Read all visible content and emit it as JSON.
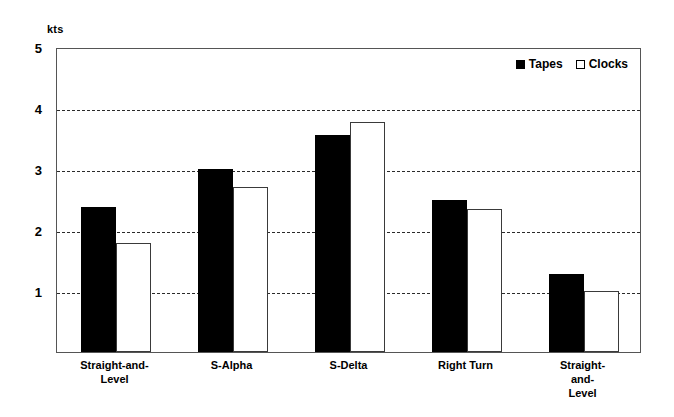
{
  "chart_data": {
    "type": "bar",
    "title": "",
    "subtitle": "",
    "xlabel": "",
    "ylabel": "kts",
    "unit_label": "kts",
    "ylim": [
      0,
      5
    ],
    "yticks": [
      1,
      2,
      3,
      4,
      5
    ],
    "ytick_labels": [
      "1",
      "2",
      "3",
      "4",
      "5"
    ],
    "grid": true,
    "grid_axis": "y",
    "grid_style": "dashed",
    "legend_position": "top-right",
    "categories": [
      "Straight-and-\nLevel",
      "S-Alpha",
      "S-Delta",
      "Right Turn",
      "Straight-and-\nLevel"
    ],
    "series": [
      {
        "name": "Tapes",
        "style": "filled",
        "color": "#000000",
        "values": [
          2.37,
          3.0,
          3.55,
          2.5,
          1.28
        ]
      },
      {
        "name": "Clocks",
        "style": "hollow",
        "color": "#ffffff",
        "values": [
          1.78,
          2.7,
          3.77,
          2.35,
          1.0
        ]
      }
    ]
  },
  "legend": {
    "entries": [
      {
        "label": "Tapes",
        "swatch": "filled-square-icon"
      },
      {
        "label": "Clocks",
        "swatch": "hollow-square-icon"
      }
    ]
  },
  "colors": {
    "background": "#ffffff",
    "axis": "#555555",
    "grid": "#2b2b2b",
    "tapes": "#000000",
    "clocks": "#ffffff",
    "clocks_outline": "#3a3a3a",
    "text": "#000000"
  }
}
